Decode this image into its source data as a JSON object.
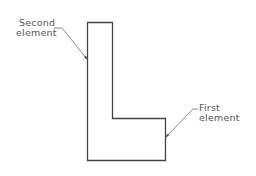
{
  "diagram": {
    "shape": "L-shaped outline composed of two rectangular elements",
    "colors": {
      "outline": "#444444",
      "leader": "#555555",
      "text": "#555555",
      "background": "#ffffff"
    },
    "labels": {
      "second": {
        "line1": "Second",
        "line2": "element"
      },
      "first": {
        "line1": "First",
        "line2": "element"
      }
    }
  }
}
